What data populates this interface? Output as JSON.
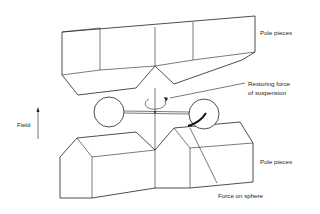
{
  "diagram": {
    "type": "physics-apparatus",
    "labels": {
      "pole_pieces_top": "Pole pieces",
      "restoring_force": "Restoring force",
      "restoring_force_line2": "of suspension",
      "field": "Field",
      "pole_pieces_bottom": "Pole pieces",
      "force_on_sphere": "Force on sphere"
    },
    "components": [
      {
        "id": "upper-pole-pieces",
        "label": "Pole pieces"
      },
      {
        "id": "lower-pole-pieces",
        "label": "Pole pieces"
      },
      {
        "id": "left-sphere"
      },
      {
        "id": "right-sphere"
      },
      {
        "id": "suspension-fiber"
      },
      {
        "id": "cross-bar"
      },
      {
        "id": "rotation-arrow",
        "label": "Restoring force of suspension"
      },
      {
        "id": "force-arrow",
        "label": "Force on sphere"
      },
      {
        "id": "field-arrow",
        "label": "Field",
        "direction": "up"
      }
    ],
    "colors": {
      "stroke": "#222222",
      "background": "#ffffff"
    }
  }
}
